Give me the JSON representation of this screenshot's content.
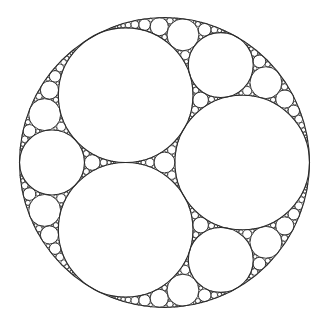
{
  "figure": {
    "stroke_color": "#2b2b2b",
    "background_color": "#ffffff",
    "configuration": {
      "outer_circles": 1,
      "primary_inner_circles": 3,
      "primary_inner_equal": true,
      "orientation": "one primary circle on the right, two on the left (top and bottom)"
    }
  }
}
